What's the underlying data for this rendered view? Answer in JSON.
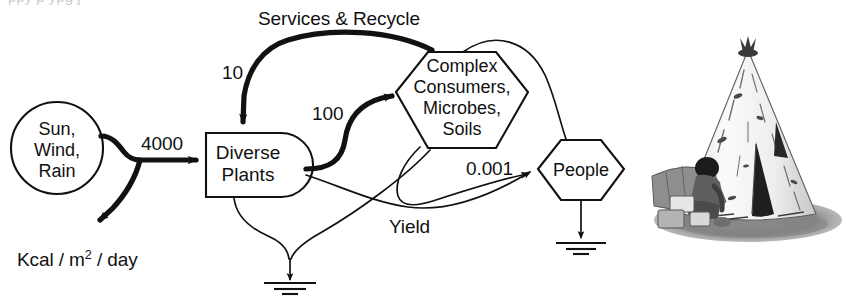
{
  "figure": {
    "kind": "energy-systems-language-diagram",
    "units_label": "Kcal / m2 / day",
    "units_label_prefix": "Kcal / m",
    "units_label_exponent": "2",
    "units_label_suffix": " / day"
  },
  "nodes": {
    "source": {
      "name": "energy-source",
      "shape": "circle",
      "lines": [
        "Sun,",
        "Wind,",
        "Rain"
      ]
    },
    "producer": {
      "name": "producer",
      "shape": "producer-bullet",
      "lines": [
        "Diverse",
        "Plants"
      ]
    },
    "consumer": {
      "name": "consumer",
      "shape": "hexagon",
      "lines": [
        "Complex",
        "Consumers,",
        "Microbes,",
        "Soils"
      ]
    },
    "people": {
      "name": "people-consumer",
      "shape": "hexagon",
      "lines": [
        "People"
      ]
    }
  },
  "flows": [
    {
      "id": "solar-input",
      "label": "4000",
      "weight": "thick",
      "from": "source",
      "to": "producer"
    },
    {
      "id": "solar-dispersal",
      "label": "",
      "weight": "thick",
      "from": "source",
      "to": "heat-sink-left"
    },
    {
      "id": "services-recycle",
      "label": "10",
      "weight": "thick",
      "from": "consumer",
      "to": "producer"
    },
    {
      "id": "plants-to-consumer",
      "label": "100",
      "weight": "thick",
      "from": "producer",
      "to": "consumer"
    },
    {
      "id": "consumer-to-people",
      "label": "0.001",
      "weight": "thin",
      "from": "consumer",
      "to": "people"
    },
    {
      "id": "plants-to-people",
      "label": "Yield",
      "weight": "thin",
      "from": "producer",
      "to": "people"
    },
    {
      "id": "people-feedback",
      "label": "",
      "weight": "thin",
      "from": "people",
      "to": "consumer"
    },
    {
      "id": "plants-heat-loss",
      "label": "",
      "weight": "thin",
      "from": "producer",
      "to": "heat-sink-center"
    },
    {
      "id": "consumer-heat-loss",
      "label": "",
      "weight": "thin",
      "from": "consumer",
      "to": "heat-sink-center"
    },
    {
      "id": "people-heat-loss",
      "label": "",
      "weight": "thin",
      "from": "people",
      "to": "heat-sink-people"
    }
  ],
  "labels": {
    "services_recycle": "Services & Recycle",
    "ten": "10",
    "hundred": "100",
    "four_thousand": "4000",
    "point_zero_zero_one": "0.001",
    "yield": "Yield",
    "units": "Kcal / m"
  },
  "heat_sinks": [
    {
      "id": "heat-sink-center",
      "name": "heat-sink-center"
    },
    {
      "id": "heat-sink-people",
      "name": "heat-sink-people"
    }
  ],
  "illustration": {
    "name": "thatched-hut-photo",
    "description": "grayscale illustration of a conical thatched hut with a person kneeling beside it",
    "alt": "Conical thatched hut with person"
  },
  "scan_artifacts": {
    "top_strip": "ppy p ypg j"
  },
  "colors": {
    "background": "#ffffff",
    "ink": "#111111",
    "photo_mid": "#8c8c8c",
    "photo_dark": "#2e2e2e",
    "photo_light": "#f2f2f2"
  }
}
